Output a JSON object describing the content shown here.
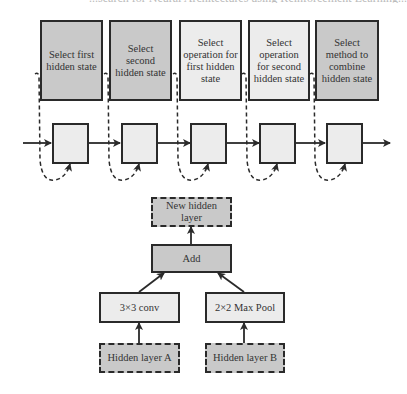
{
  "caption_cutoff": "...search for Neural Architectures using Reinforcement Learning...",
  "controller": {
    "steps": [
      {
        "label": "Select first hidden state",
        "shade": "gray"
      },
      {
        "label": "Select second hidden state",
        "shade": "gray"
      },
      {
        "label": "Select operation for first hidden state",
        "shade": "light"
      },
      {
        "label": "Select operation for second hidden state",
        "shade": "light"
      },
      {
        "label": "Select method to combine hidden state",
        "shade": "gray"
      }
    ],
    "rnn_cells": 5
  },
  "block": {
    "output": "New hidden layer",
    "combine": "Add",
    "op_left": "3×3 conv",
    "op_right": "2×2 Max Pool",
    "input_left": "Hidden layer A",
    "input_right": "Hidden layer B"
  },
  "colors": {
    "gray_fill": "#c9c9c9",
    "light_fill": "#ececec",
    "stroke": "#2a2a2a"
  }
}
